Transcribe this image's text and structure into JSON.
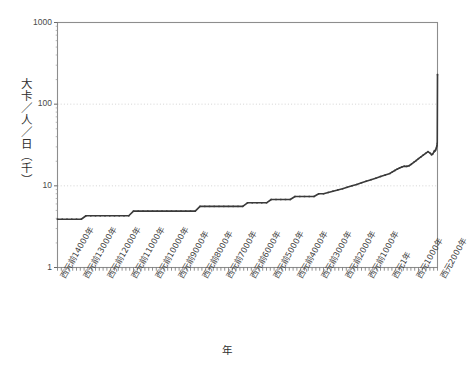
{
  "chart_data": {
    "type": "line",
    "title": "",
    "xlabel": "年",
    "ylabel": "大卡／人／日（千）",
    "yscale": "log",
    "ylim": [
      1,
      1000
    ],
    "ytick_labels": [
      "1000",
      "100",
      "10",
      "1"
    ],
    "ytick_values": [
      1000,
      100,
      10,
      1
    ],
    "grid": "horizontal-dotted",
    "legend": "none",
    "xlim": [
      -14000,
      2000
    ],
    "xtick_labels": [
      "西元前14000年",
      "西元前13000年",
      "西元前12000年",
      "西元前11000年",
      "西元前10000年",
      "西元前9000年",
      "西元前8000年",
      "西元前7000年",
      "西元前6000年",
      "西元前5000年",
      "西元前4000年",
      "西元前3000年",
      "西元前2000年",
      "西元前1000年",
      "西元1年",
      "西元1000年",
      "西元2000年"
    ],
    "xtick_values": [
      -14000,
      -13000,
      -12000,
      -11000,
      -10000,
      -9000,
      -8000,
      -7000,
      -6000,
      -5000,
      -4000,
      -3000,
      -2000,
      -1000,
      1,
      1000,
      2000
    ],
    "series": [
      {
        "name": "大卡／人／日（千）",
        "color": "#3a3a3a",
        "x": [
          -14000,
          -13800,
          -13600,
          -13400,
          -13200,
          -13000,
          -12800,
          -12600,
          -12400,
          -12200,
          -12000,
          -11800,
          -11600,
          -11400,
          -11200,
          -11000,
          -10800,
          -10600,
          -10400,
          -10200,
          -10000,
          -9800,
          -9600,
          -9400,
          -9200,
          -9000,
          -8800,
          -8600,
          -8400,
          -8200,
          -8000,
          -7800,
          -7600,
          -7400,
          -7200,
          -7000,
          -6800,
          -6600,
          -6400,
          -6200,
          -6000,
          -5800,
          -5600,
          -5400,
          -5200,
          -5000,
          -4800,
          -4600,
          -4400,
          -4200,
          -4000,
          -3800,
          -3600,
          -3400,
          -3200,
          -3000,
          -2800,
          -2600,
          -2400,
          -2200,
          -2000,
          -1800,
          -1600,
          -1400,
          -1200,
          -1000,
          -800,
          -600,
          -400,
          -200,
          1,
          100,
          200,
          300,
          400,
          500,
          600,
          700,
          800,
          900,
          1000,
          1100,
          1200,
          1300,
          1400,
          1500,
          1600,
          1700,
          1750,
          1800,
          1850,
          1875,
          1900,
          1925,
          1950,
          1975,
          1990,
          2000
        ],
        "y": [
          3.9,
          3.9,
          3.9,
          3.9,
          3.9,
          3.9,
          4.3,
          4.3,
          4.3,
          4.3,
          4.3,
          4.3,
          4.3,
          4.3,
          4.3,
          4.3,
          4.9,
          4.9,
          4.9,
          4.9,
          4.9,
          4.9,
          4.9,
          4.9,
          4.9,
          4.9,
          4.9,
          4.9,
          4.9,
          4.9,
          5.6,
          5.6,
          5.6,
          5.6,
          5.6,
          5.6,
          5.6,
          5.6,
          5.6,
          5.6,
          6.2,
          6.2,
          6.2,
          6.2,
          6.2,
          6.8,
          6.8,
          6.8,
          6.8,
          6.8,
          7.4,
          7.4,
          7.4,
          7.4,
          7.4,
          8.0,
          8.0,
          8.3,
          8.6,
          8.9,
          9.2,
          9.6,
          10.0,
          10.4,
          10.9,
          11.4,
          11.9,
          12.4,
          13.0,
          13.6,
          14.2,
          14.8,
          15.4,
          16.0,
          16.5,
          17.0,
          17.4,
          17.3,
          17.6,
          18.4,
          19.4,
          20.4,
          21.5,
          22.6,
          23.8,
          25.0,
          26.2,
          25.0,
          24.0,
          24.6,
          26.0,
          27.0,
          26.8,
          27.6,
          29.0,
          31.0,
          33.0,
          230
        ]
      }
    ]
  }
}
